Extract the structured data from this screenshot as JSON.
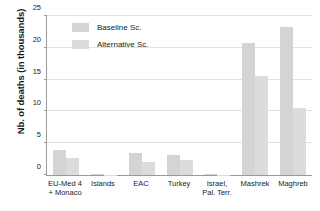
{
  "chart_data": {
    "type": "bar",
    "title": "",
    "xlabel": "",
    "ylabel": "Nb. of deaths (in thousands)",
    "ylim": [
      0,
      25
    ],
    "yticks": [
      0,
      5,
      10,
      15,
      20,
      25
    ],
    "ytick_labels": [
      "0",
      "5",
      "10",
      "15",
      "20",
      "25"
    ],
    "grid": true,
    "legend_position": "top-left-inside",
    "categories": [
      "EU-Med 4\n+ Monaco",
      "Islands",
      "EAC",
      "Turkey",
      "Israel,\nPal. Terr.",
      "Mashrek",
      "Maghreb"
    ],
    "series": [
      {
        "name": "Baseline Sc.",
        "color": "#d4d4d4",
        "values": [
          3.9,
          0.1,
          3.5,
          3.2,
          0.1,
          20.6,
          23.2
        ]
      },
      {
        "name": "Alternative Sc.",
        "color": "#dcdcdc",
        "values": [
          2.7,
          0.05,
          2.0,
          2.4,
          0.05,
          15.5,
          10.4
        ]
      }
    ]
  },
  "axis": {
    "y_title": "Nb. of deaths (in thousands)"
  },
  "legend": {
    "items": [
      {
        "label": "Baseline Sc."
      },
      {
        "label": "Alternative Sc."
      }
    ]
  }
}
